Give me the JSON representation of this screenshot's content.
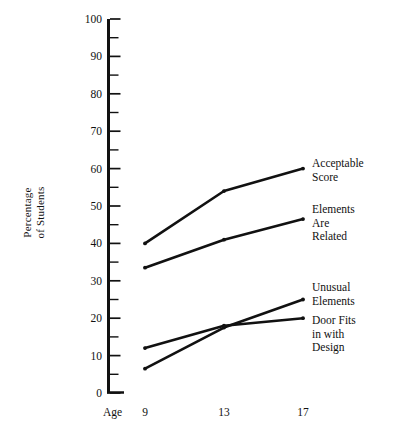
{
  "chart_data": {
    "type": "line",
    "title": "",
    "xlabel": "Age",
    "ylabel": "Percentage\nof Students",
    "x": [
      9,
      13,
      17
    ],
    "xtick_labels": [
      "9",
      "13",
      "17"
    ],
    "ylim": [
      0,
      100
    ],
    "ytick_labels": [
      "0",
      "10",
      "20",
      "30",
      "40",
      "50",
      "60",
      "70",
      "80",
      "90",
      "100"
    ],
    "ytick_values": [
      0,
      10,
      20,
      30,
      40,
      50,
      60,
      70,
      80,
      90,
      100
    ],
    "yminor_values": [
      5,
      15,
      25,
      35,
      45,
      55,
      65,
      75,
      85,
      95
    ],
    "grid": false,
    "legend_position": "right-inline-labels",
    "series": [
      {
        "name": "Acceptable\nScore",
        "label_line1": "Acceptable",
        "label_line2": "Score",
        "values": [
          40,
          54,
          60
        ],
        "color": "#111111"
      },
      {
        "name": "Elements\nAre\nRelated",
        "label_line1": "Elements",
        "label_line2": "Are",
        "label_line3": "Related",
        "values": [
          33.5,
          41,
          46.5
        ],
        "color": "#111111"
      },
      {
        "name": "Unusual\nElements",
        "label_line1": "Unusual",
        "label_line2": "Elements",
        "values": [
          6.5,
          17.5,
          25
        ],
        "color": "#111111"
      },
      {
        "name": "Door Fits\nin with\nDesign",
        "label_line1": "Door Fits",
        "label_line2": "in with",
        "label_line3": "Design",
        "values": [
          12,
          18,
          20
        ],
        "color": "#111111"
      }
    ]
  },
  "axis": {
    "y_title": "Percentage\nof Students",
    "x_title": "Age"
  },
  "y_ticks": {
    "t100": "100",
    "t90": "90",
    "t80": "80",
    "t70": "70",
    "t60": "60",
    "t50": "50",
    "t40": "40",
    "t30": "30",
    "t20": "20",
    "t10": "10",
    "t0": "0"
  },
  "x_ticks": {
    "t9": "9",
    "t13": "13",
    "t17": "17"
  },
  "labels": {
    "acceptable_score": "Acceptable\nScore",
    "elements_are_related": "Elements\nAre\nRelated",
    "unusual_elements": "Unusual\nElements",
    "door_fits": "Door Fits\nin with\nDesign"
  },
  "colors": {
    "line": "#111111",
    "axis": "#111111",
    "background": "#ffffff"
  }
}
